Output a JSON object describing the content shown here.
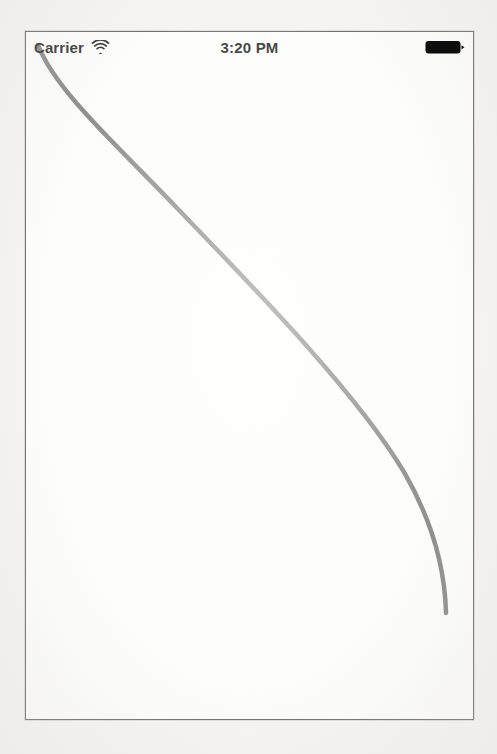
{
  "app": {
    "title": "iOS Simulator Screen",
    "background_color": "#f4f3f1",
    "screen_color": "#fdfdfc",
    "frame_border_color": "#5a5a5a"
  },
  "status_bar": {
    "carrier_label": "Carrier",
    "wifi_icon": "wifi-icon",
    "time": "3:20 PM",
    "battery_icon": "battery-full-icon",
    "battery_level_percent": 100,
    "text_color": "#1a1a1a"
  },
  "drawing": {
    "name": "bezier-curve",
    "stroke_color": "#7d7d7d",
    "stroke_width": 4.5,
    "line_cap": "round",
    "fill": "none",
    "path": "M 12 13 C 30 60 96 118 150 175 C 230 258 330 360 378 440 C 408 492 419 540 420 581",
    "start_point": [
      12,
      13
    ],
    "end_point": [
      420,
      581
    ],
    "control_points": [
      [
        30,
        60
      ],
      [
        96,
        118
      ],
      [
        230,
        258
      ],
      [
        330,
        360
      ],
      [
        408,
        492
      ],
      [
        419,
        540
      ]
    ]
  },
  "chart_data": {
    "type": "line",
    "title": "",
    "xlabel": "",
    "ylabel": "",
    "grid": false,
    "legend": "none",
    "xlim": [
      0,
      447
    ],
    "ylim": [
      0,
      687
    ],
    "series": [
      {
        "name": "bezier-curve",
        "color": "#7d7d7d",
        "x": [
          12,
          27,
          63,
          110,
          150,
          183,
          218,
          275,
          310,
          353,
          378,
          403,
          414,
          420
        ],
        "y": [
          13,
          35,
          89,
          148,
          175,
          209,
          248,
          309,
          352,
          419,
          440,
          509,
          551,
          581
        ]
      }
    ]
  }
}
